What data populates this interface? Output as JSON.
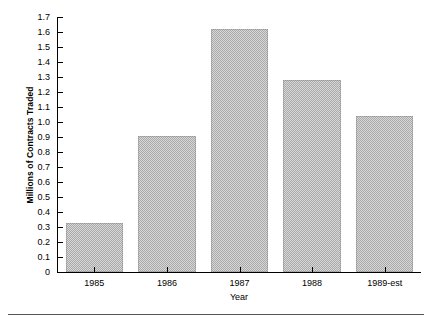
{
  "chart_data": {
    "type": "bar",
    "title": "",
    "xlabel": "Year",
    "ylabel": "Millions of Contracts Traded",
    "categories": [
      "1985",
      "1986",
      "1987",
      "1988",
      "1989-est"
    ],
    "values": [
      0.33,
      0.91,
      1.62,
      1.28,
      1.04
    ],
    "ylim": [
      0,
      1.7
    ],
    "xlim_note": "categorical",
    "yticks": [
      0,
      0.1,
      0.2,
      0.3,
      0.4,
      0.5,
      0.6,
      0.7,
      0.8,
      0.9,
      1.0,
      1.1,
      1.2,
      1.3,
      1.4,
      1.5,
      1.6,
      1.7
    ],
    "ytick_labels": [
      "0",
      "0.1",
      "0.2",
      "0.3",
      "0.4",
      "0.5",
      "0.6",
      "0.7",
      "0.8",
      "0.9",
      "1.0",
      "1.1",
      "1.2",
      "1.3",
      "1.4",
      "1.5",
      "1.6",
      "1.7"
    ],
    "grid": false,
    "legend": null,
    "legend_position": "none",
    "bar_color": "#a9a9a9",
    "bar_fill_style": "gray-dither-hatch",
    "axis_color": "#000000",
    "background_color": "#ffffff"
  },
  "figure": {
    "bottom_rule_color": "#555555"
  }
}
